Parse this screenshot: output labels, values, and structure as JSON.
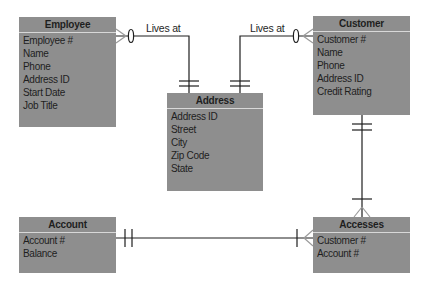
{
  "diagram": {
    "type": "entity-relationship",
    "colors": {
      "entity_fill": "#8e8e8e",
      "line": "#1e1e1e",
      "background": "#ffffff"
    },
    "entities": {
      "employee": {
        "title": "Employee",
        "attributes": [
          "Employee #",
          "Name",
          "Phone",
          "Address ID",
          "Start Date",
          "Job Title"
        ]
      },
      "customer": {
        "title": "Customer",
        "attributes": [
          "Customer #",
          "Name",
          "Phone",
          "Address ID",
          "Credit Rating"
        ]
      },
      "address": {
        "title": "Address",
        "attributes": [
          "Address ID",
          "Street",
          "City",
          "Zip Code",
          "State"
        ]
      },
      "account": {
        "title": "Account",
        "attributes": [
          "Account #",
          "Balance"
        ]
      },
      "accesses": {
        "title": "Accesses",
        "attributes": [
          "Customer #",
          "Account #"
        ]
      }
    },
    "relationships": [
      {
        "from": "Employee",
        "to": "Address",
        "label": "Lives at",
        "from_cardinality": "zero-or-many",
        "to_cardinality": "one-and-only-one"
      },
      {
        "from": "Customer",
        "to": "Address",
        "label": "Lives at",
        "from_cardinality": "zero-or-many",
        "to_cardinality": "one-and-only-one"
      },
      {
        "from": "Customer",
        "to": "Accesses",
        "label": "",
        "from_cardinality": "one-and-only-one",
        "to_cardinality": "one-or-many"
      },
      {
        "from": "Account",
        "to": "Accesses",
        "label": "",
        "from_cardinality": "one-and-only-one",
        "to_cardinality": "one-or-many"
      }
    ],
    "labels": {
      "employee_lives_at": "Lives at",
      "customer_lives_at": "Lives at"
    }
  }
}
